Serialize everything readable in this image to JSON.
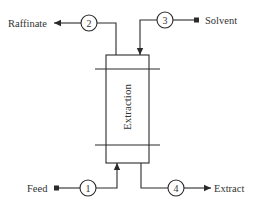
{
  "diagram": {
    "type": "process-flow",
    "unit": {
      "label": "Extraction"
    },
    "streams": [
      {
        "number": "1",
        "label": "Feed",
        "direction": "in",
        "connects": "bottom"
      },
      {
        "number": "2",
        "label": "Raffinate",
        "direction": "out",
        "connects": "top"
      },
      {
        "number": "3",
        "label": "Solvent",
        "direction": "in",
        "connects": "top"
      },
      {
        "number": "4",
        "label": "Extract",
        "direction": "out",
        "connects": "bottom"
      }
    ],
    "colors": {
      "line": "#2a2a2a",
      "text": "#333333",
      "background": "#ffffff"
    }
  }
}
